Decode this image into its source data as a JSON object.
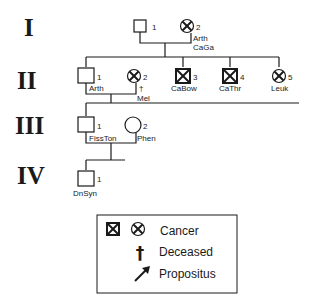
{
  "generations": [
    {
      "label": "I"
    },
    {
      "label": "II"
    },
    {
      "label": "III"
    },
    {
      "label": "IV"
    }
  ],
  "individuals": {
    "I1": {
      "number": "1",
      "sex": "male",
      "affected": false,
      "label": ""
    },
    "I2": {
      "number": "2",
      "sex": "female",
      "affected": true,
      "label": "Arth",
      "label2": "CaGa"
    },
    "II1": {
      "number": "1",
      "sex": "male",
      "affected": false,
      "label": "Arth"
    },
    "II2": {
      "number": "2",
      "sex": "female",
      "affected": true,
      "deceased": true,
      "deceased_symbol": "†",
      "label": "Mel"
    },
    "II3": {
      "number": "3",
      "sex": "male",
      "affected": true,
      "label": "CaBow"
    },
    "II4": {
      "number": "4",
      "sex": "male",
      "affected": true,
      "label": "CaThr"
    },
    "II5": {
      "number": "5",
      "sex": "female",
      "affected": true,
      "label": "Leuk"
    },
    "III1": {
      "number": "1",
      "sex": "male",
      "affected": false,
      "label": "FissTon"
    },
    "III2": {
      "number": "2",
      "sex": "female",
      "affected": false,
      "label": "Phen"
    },
    "IV1": {
      "number": "1",
      "sex": "male",
      "affected": false,
      "label": "DnSyn"
    }
  },
  "legend": {
    "cancer": "Cancer",
    "deceased": "Deceased",
    "deceased_symbol": "†",
    "propositus": "Propositus"
  },
  "colors": {
    "ink": "#1a1a1a",
    "background": "#ffffff"
  }
}
